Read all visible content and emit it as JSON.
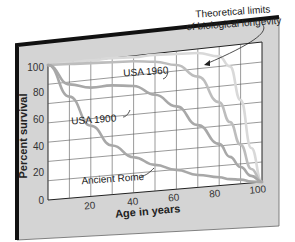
{
  "chart_data": {
    "type": "line",
    "title": "",
    "xlabel": "Age in years",
    "ylabel": "Percent survival",
    "xlim": [
      0,
      100
    ],
    "ylim": [
      0,
      100
    ],
    "x_ticks": [
      "20",
      "40",
      "60",
      "80",
      "100"
    ],
    "y_ticks": [
      "0",
      "20",
      "40",
      "60",
      "80",
      "100"
    ],
    "grid": true,
    "legend": "inline annotations",
    "x": [
      0,
      10,
      20,
      30,
      40,
      50,
      60,
      70,
      80,
      85,
      90,
      95,
      100
    ],
    "series": [
      {
        "name": "Theoretical limits of biological longevity",
        "color": "#d9d9d9",
        "values": [
          100,
          100,
          100,
          100,
          99,
          99,
          98,
          97,
          93,
          85,
          60,
          25,
          0
        ]
      },
      {
        "name": "USA 1960",
        "color": "#bdbdbd",
        "values": [
          100,
          99,
          98,
          97,
          96,
          94,
          90,
          80,
          60,
          45,
          28,
          10,
          0
        ]
      },
      {
        "name": "USA 1900",
        "color": "#a8a8a8",
        "values": [
          100,
          84,
          80,
          80,
          78,
          70,
          60,
          45,
          30,
          20,
          12,
          5,
          0
        ]
      },
      {
        "name": "Ancient Rome",
        "color": "#a8a8a8",
        "values": [
          100,
          75,
          52,
          36,
          26,
          19,
          14,
          9,
          6,
          4,
          3,
          1,
          0
        ]
      }
    ],
    "annotations": [
      "Theoretical limits of biological longevity",
      "USA 1960",
      "USA 1900",
      "Ancient Rome"
    ]
  },
  "labels": {
    "theoretical_line1": "Theoretical limits",
    "theoretical_line2": "of biological longevity",
    "usa1960": "USA 1960",
    "usa1900": "USA 1900",
    "rome": "Ancient Rome",
    "xlabel": "Age in years",
    "ylabel": "Percent survival",
    "y0": "0",
    "y20": "20",
    "y40": "40",
    "y60": "60",
    "y80": "80",
    "y100": "100",
    "x20": "20",
    "x40": "40",
    "x60": "60",
    "x80": "80",
    "x100": "100"
  },
  "colors": {
    "frame": "#d4d4d4",
    "frame_edge": "#111111",
    "plot_bg": "#ffffff",
    "grid": "#555555"
  }
}
